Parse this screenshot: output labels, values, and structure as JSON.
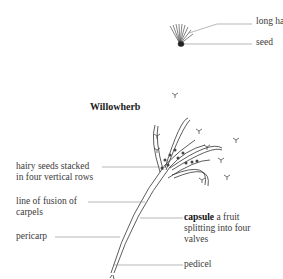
{
  "title": "Willowherb",
  "seed_detail": {
    "labels": [
      "long hairs",
      "seed"
    ]
  },
  "main_labels": {
    "hairy_seeds_1": "hairy seeds stacked",
    "hairy_seeds_2": "in four vertical rows",
    "fusion_1": "line of fusion of",
    "fusion_2": "carpels",
    "pericarp": "pericarp",
    "capsule_bold": "capsule",
    "capsule_1": " a fruit",
    "capsule_2": "splitting into four",
    "capsule_3": "valves",
    "pedicel": "pedicel"
  }
}
